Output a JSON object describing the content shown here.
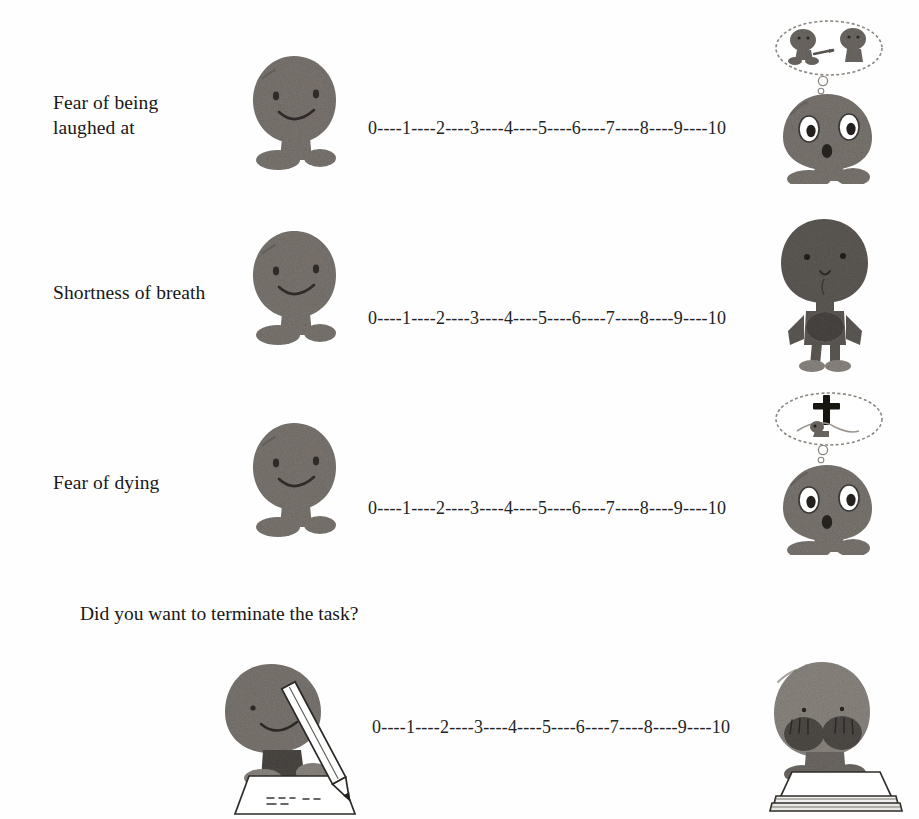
{
  "page": {
    "background": "#ffffff",
    "ink_color": "#171717",
    "figure_fill": "#7b7670",
    "figure_fill_dark": "#4a4643",
    "figure_fill_light": "#9d9892"
  },
  "scale": {
    "text": "0----1----2----3----4----5----6----7----8----9----10",
    "min": 0,
    "max": 10,
    "tick_labels": [
      "0",
      "1",
      "2",
      "3",
      "4",
      "5",
      "6",
      "7",
      "8",
      "9",
      "10"
    ],
    "separator": "----"
  },
  "items": [
    {
      "id": "fear-of-being-laughed-at",
      "label": "Fear of being\nlaughed at",
      "left_figure": "calm-sitting-figure",
      "right_figure": "shocked-figure-with-laughing-people-thought-bubble",
      "scale_text": "0----1----2----3----4----5----6----7----8----9----10"
    },
    {
      "id": "shortness-of-breath",
      "label": "Shortness of breath",
      "left_figure": "calm-sitting-figure",
      "right_figure": "standing-figure-clutching-chest",
      "scale_text": "0----1----2----3----4----5----6----7----8----9----10"
    },
    {
      "id": "fear-of-dying",
      "label": "Fear of dying",
      "left_figure": "calm-sitting-figure",
      "right_figure": "shocked-figure-with-grave-cross-thought-bubble",
      "scale_text": "0----1----2----3----4----5----6----7----8----9----10"
    }
  ],
  "termination": {
    "question": "Did you want to terminate the task?",
    "left_figure": "figure-writing-with-pencil",
    "right_figure": "figure-covering-face-over-papers",
    "scale_text": "0----1----2----3----4----5----6----7----8----9----10"
  }
}
